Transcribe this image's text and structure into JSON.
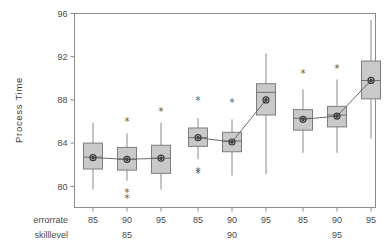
{
  "chart_data": {
    "type": "box",
    "title": "",
    "xlabel": "",
    "ylabel": "Process Time",
    "ylim": [
      78,
      96
    ],
    "yticks": [
      80,
      84,
      88,
      92,
      96
    ],
    "ytick_labels": [
      "80",
      "84",
      "88",
      "92",
      "96"
    ],
    "grid": false,
    "legend": "none",
    "factors": [
      {
        "name": "errorrate",
        "levels": [
          "85",
          "90",
          "95"
        ]
      },
      {
        "name": "skilllevel",
        "levels": [
          "85",
          "90",
          "95"
        ]
      }
    ],
    "groups": [
      {
        "skilllevel": "85",
        "boxes": [
          {
            "errorrate": "85",
            "lower_whisker": 79.7,
            "q1": 81.6,
            "median": 82.7,
            "q3": 84.0,
            "upper_whisker": 85.9,
            "mean": 82.65,
            "outliers": []
          },
          {
            "errorrate": "90",
            "lower_whisker": 80.5,
            "q1": 81.5,
            "median": 82.5,
            "q3": 83.6,
            "upper_whisker": 84.9,
            "mean": 82.5,
            "outliers": [
              86.0,
              79.4,
              78.9
            ]
          },
          {
            "errorrate": "95",
            "lower_whisker": 79.7,
            "q1": 81.2,
            "median": 82.6,
            "q3": 83.8,
            "upper_whisker": 85.9,
            "mean": 82.6,
            "outliers": [
              86.9
            ]
          }
        ]
      },
      {
        "skilllevel": "90",
        "boxes": [
          {
            "errorrate": "85",
            "lower_whisker": 82.5,
            "q1": 83.7,
            "median": 84.5,
            "q3": 85.4,
            "upper_whisker": 86.3,
            "mean": 84.5,
            "outliers": [
              87.9,
              81.4,
              81.2
            ]
          },
          {
            "errorrate": "90",
            "lower_whisker": 81.0,
            "q1": 83.2,
            "median": 84.2,
            "q3": 85.0,
            "upper_whisker": 86.2,
            "mean": 84.1,
            "outliers": [
              87.8
            ]
          },
          {
            "errorrate": "95",
            "lower_whisker": 81.1,
            "q1": 86.6,
            "median": 88.7,
            "q3": 89.5,
            "upper_whisker": 92.3,
            "mean": 88.0,
            "outliers": []
          }
        ]
      },
      {
        "skilllevel": "95",
        "boxes": [
          {
            "errorrate": "85",
            "lower_whisker": 83.1,
            "q1": 85.2,
            "median": 86.3,
            "q3": 87.1,
            "upper_whisker": 89.0,
            "mean": 86.2,
            "outliers": [
              90.4
            ]
          },
          {
            "errorrate": "90",
            "lower_whisker": 83.1,
            "q1": 85.5,
            "median": 86.6,
            "q3": 87.4,
            "upper_whisker": 89.9,
            "mean": 86.5,
            "outliers": [
              90.9
            ]
          },
          {
            "errorrate": "95",
            "lower_whisker": 84.4,
            "q1": 88.1,
            "median": 89.8,
            "q3": 91.6,
            "upper_whisker": 95.4,
            "mean": 89.8,
            "outliers": []
          }
        ]
      }
    ],
    "mean_connector": true,
    "outlier_marker": "*",
    "colors": {
      "box_fill": "#c9c9c9",
      "box_stroke": "#7d7d7d",
      "whisker": "#8a8a8a",
      "frame": "#8c8c8c",
      "text": "#4a4a4a",
      "connector": "#6b6b6b"
    }
  }
}
